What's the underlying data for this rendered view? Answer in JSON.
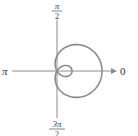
{
  "chart_data": {
    "type": "line",
    "subtype": "polar",
    "title": "",
    "equation": "r = 1 + 2cos(θ)",
    "curve_name": "limaçon with inner loop",
    "angle_labels": {
      "right": "0",
      "top_num": "π",
      "top_den": "2",
      "left": "π",
      "bottom_num": "3π",
      "bottom_den": "2"
    },
    "parameters": {
      "a": 1,
      "b": 2
    },
    "key_points": [
      {
        "theta": "0",
        "r": 3
      },
      {
        "theta": "π/2",
        "r": 1
      },
      {
        "theta": "π",
        "r": -1
      },
      {
        "theta": "3π/2",
        "r": 1
      },
      {
        "theta": "2π/3",
        "r": 0
      },
      {
        "theta": "4π/3",
        "r": 0
      }
    ],
    "grid": false,
    "legend": null
  },
  "colors": {
    "curve": "#8a8a8a",
    "axis": "#777777",
    "text": "#333333"
  }
}
